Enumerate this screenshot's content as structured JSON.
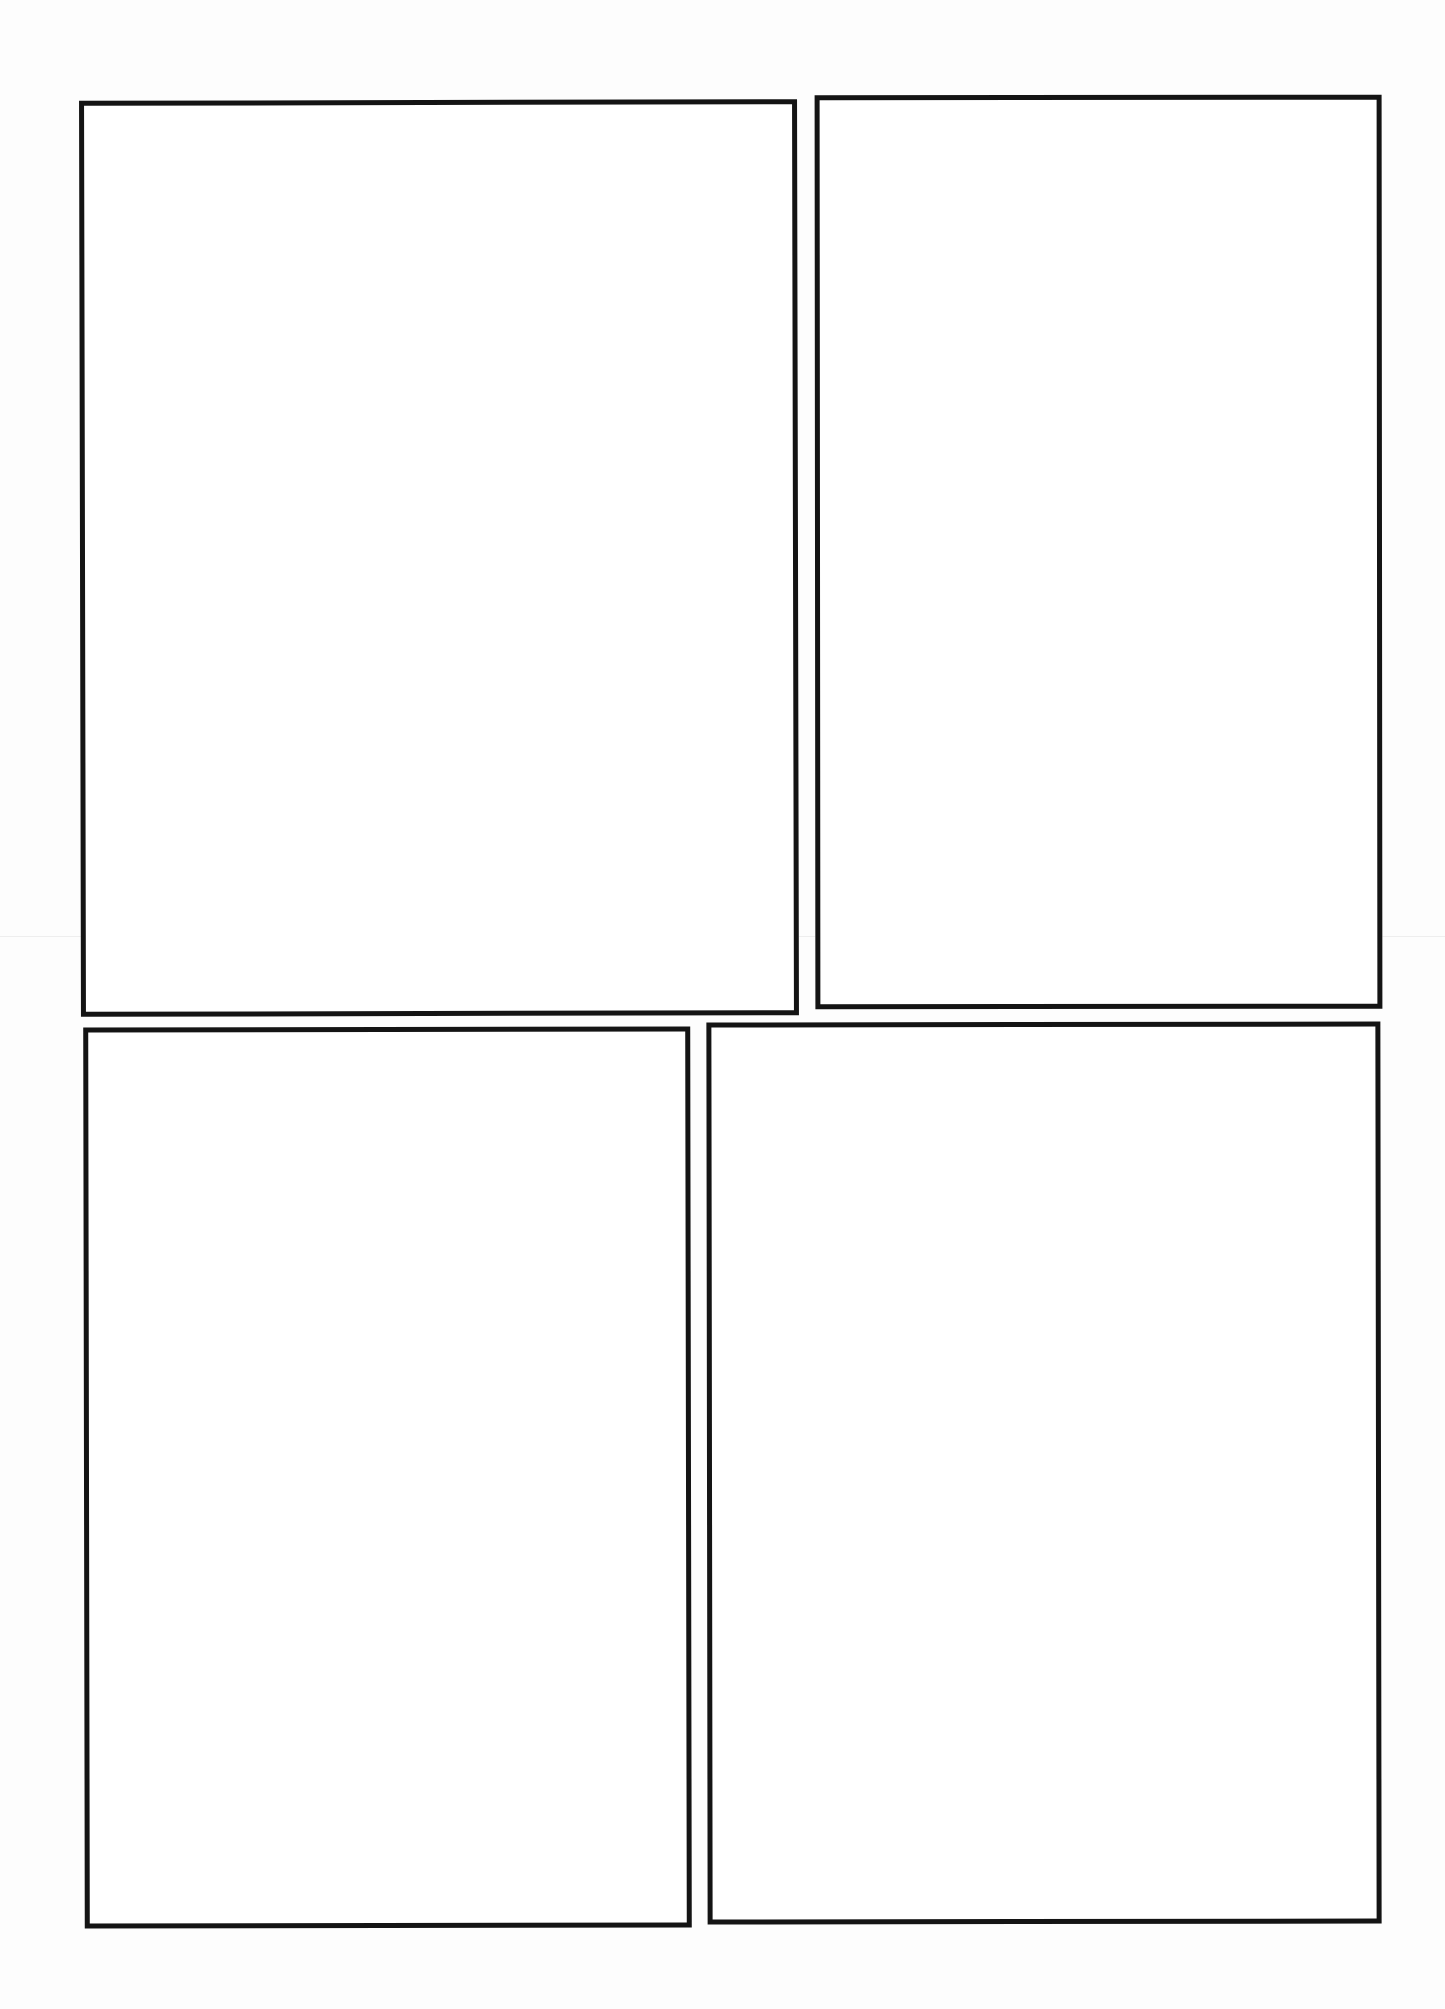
{
  "page": {
    "type": "comic-page-template",
    "background_color": "#ffffff",
    "border_color": "#141414",
    "panel_count": 4
  },
  "panels": [
    {
      "id": "panel-1",
      "row": 1,
      "position": "top-left",
      "content": ""
    },
    {
      "id": "panel-2",
      "row": 1,
      "position": "top-right",
      "content": ""
    },
    {
      "id": "panel-3",
      "row": 2,
      "position": "bottom-left",
      "content": ""
    },
    {
      "id": "panel-4",
      "row": 2,
      "position": "bottom-right",
      "content": ""
    }
  ]
}
